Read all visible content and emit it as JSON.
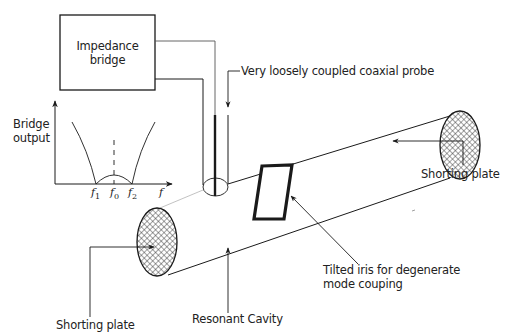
{
  "diagram": {
    "type": "experimental-setup",
    "colors": {
      "line": "#1a1a1a",
      "text": "#222222",
      "background": "#ffffff",
      "hatch": "#333333",
      "faint_line": "#bbbbbb"
    },
    "components": {
      "impedance_bridge": {
        "line1": "Impedance",
        "line2": "bridge"
      },
      "probe": {
        "label": "Very loosely coupled coaxial probe"
      },
      "cavity": {
        "label": "Resonant Cavity"
      },
      "shorting_plate_right": {
        "label": "Shorting plate"
      },
      "shorting_plate_left": {
        "label": "Shorting plate"
      },
      "iris": {
        "line1": "Tilted iris for degenerate",
        "line2": "mode couping"
      }
    },
    "inset_plot": {
      "ylabel_line1": "Bridge",
      "ylabel_line2": "output",
      "xlabel": "f",
      "ticks": [
        {
          "base": "f",
          "sub": "1"
        },
        {
          "base": "f",
          "sub": "0"
        },
        {
          "base": "f",
          "sub": "2"
        }
      ]
    }
  }
}
